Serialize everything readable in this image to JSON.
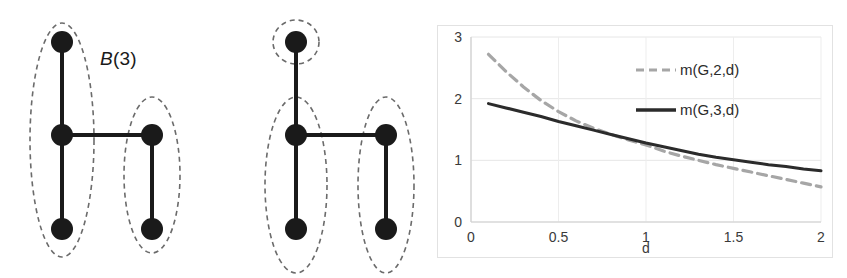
{
  "figure": {
    "panels": [
      {
        "id": "b3",
        "label_prefix": "B",
        "label_suffix": "(3)",
        "label_full": "B(3)",
        "grouping_description": "left ellipse groups three vertices, right ellipse groups two vertices"
      },
      {
        "id": "b2",
        "label_prefix": "B",
        "label_suffix": "(2)",
        "label_full": "B(2)",
        "grouping_description": "top vertex alone in a small circle, left ellipse groups two vertices, right ellipse groups two vertices"
      }
    ],
    "graph": {
      "vertex_names": [
        "top-left",
        "mid-left",
        "bottom-left",
        "mid-right",
        "bottom-right"
      ],
      "edge_names": [
        "top-left to mid-left",
        "mid-left to bottom-left",
        "mid-left to mid-right",
        "mid-right to bottom-right"
      ]
    }
  },
  "chart_data": {
    "type": "line",
    "title": "",
    "xlabel": "d",
    "ylabel": "",
    "xlim": [
      0,
      2
    ],
    "ylim": [
      0,
      3
    ],
    "xticks": [
      "0",
      "0.5",
      "1",
      "1.5",
      "2"
    ],
    "yticks": [
      "0",
      "1",
      "2",
      "3"
    ],
    "grid": true,
    "legend_position": "top-center",
    "x": [
      0.1,
      0.2,
      0.3,
      0.4,
      0.5,
      0.6,
      0.7,
      0.8,
      0.9,
      1.0,
      1.1,
      1.2,
      1.3,
      1.4,
      1.5,
      1.6,
      1.7,
      1.8,
      1.9,
      2.0
    ],
    "series": [
      {
        "name": "m(G,2,d)",
        "style": "dashed",
        "color": "#a6a6a6",
        "values": [
          2.72,
          2.44,
          2.19,
          1.97,
          1.79,
          1.64,
          1.52,
          1.42,
          1.33,
          1.25,
          1.15,
          1.07,
          1.0,
          0.93,
          0.87,
          0.81,
          0.75,
          0.69,
          0.63,
          0.57
        ]
      },
      {
        "name": "m(G,3,d)",
        "style": "solid",
        "color": "#2b2b2b",
        "values": [
          1.92,
          1.85,
          1.78,
          1.71,
          1.63,
          1.56,
          1.49,
          1.42,
          1.35,
          1.28,
          1.22,
          1.16,
          1.1,
          1.05,
          1.01,
          0.97,
          0.93,
          0.9,
          0.86,
          0.83
        ]
      }
    ],
    "legend": [
      {
        "label": "m(G,2,d)",
        "style": "dashed",
        "color": "#a6a6a6"
      },
      {
        "label": "m(G,3,d)",
        "style": "solid",
        "color": "#2b2b2b"
      }
    ]
  }
}
